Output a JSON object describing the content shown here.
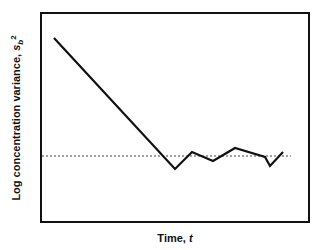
{
  "chart_data": {
    "type": "line",
    "title": "",
    "xlabel": "Time, t",
    "ylabel": "Log concentration variance, s_b^2",
    "xlabel_parts": {
      "text": "Time, ",
      "var": "t"
    },
    "ylabel_parts": {
      "text": "Log concentration variance, ",
      "var": "s",
      "sub": "b",
      "sup": "2"
    },
    "grid": false,
    "legend": null,
    "axis_ticks": false,
    "xlim": [
      0,
      1
    ],
    "ylim": [
      0,
      1
    ],
    "series": [
      {
        "name": "concentration variance",
        "style": "solid",
        "color": "#111111",
        "x": [
          0.05,
          0.5,
          0.56,
          0.64,
          0.72,
          0.84,
          0.86,
          0.9
        ],
        "y": [
          0.88,
          0.25,
          0.33,
          0.29,
          0.36,
          0.31,
          0.27,
          0.33
        ]
      },
      {
        "name": "steady-state level",
        "style": "dotted",
        "color": "#444444",
        "x": [
          0.0,
          0.93
        ],
        "y": [
          0.32,
          0.32
        ]
      }
    ],
    "pixel_polyline": [
      [
        54,
        38
      ],
      [
        175,
        169
      ],
      [
        192,
        152
      ],
      [
        213,
        161
      ],
      [
        235,
        148
      ],
      [
        265,
        157
      ],
      [
        270,
        166
      ],
      [
        283,
        152
      ]
    ],
    "pixel_dotted": {
      "x1": 42,
      "x2": 291,
      "y": 156
    }
  }
}
